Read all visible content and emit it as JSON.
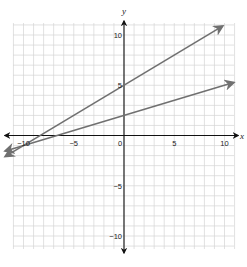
{
  "chart_data": {
    "type": "line",
    "title": "",
    "xlabel": "x",
    "ylabel": "y",
    "xlim": [
      -11,
      11
    ],
    "ylim": [
      -11.2,
      11.2
    ],
    "grid": true,
    "legend": null,
    "x_ticks": [
      {
        "value": -10,
        "label": "-10"
      },
      {
        "value": -5,
        "label": "-5"
      },
      {
        "value": 0,
        "label": "0"
      },
      {
        "value": 5,
        "label": "5"
      },
      {
        "value": 10,
        "label": "10"
      }
    ],
    "y_ticks": [
      {
        "value": 10,
        "label": "10"
      },
      {
        "value": 5,
        "label": "5"
      },
      {
        "value": -5,
        "label": "-5"
      },
      {
        "value": -10,
        "label": "-10"
      }
    ],
    "series": [
      {
        "name": "line-1",
        "equation": "y = 0.6x + 5",
        "x": [
          -11.8,
          0,
          9.8
        ],
        "y": [
          -2.08,
          5,
          10.88
        ],
        "y_intercept": 5,
        "slope": 0.6,
        "color": "#707070"
      },
      {
        "name": "line-2",
        "equation": "y = 0.3x + 2",
        "x": [
          -11.8,
          0,
          10.9
        ],
        "y": [
          -1.54,
          2,
          5.27
        ],
        "y_intercept": 2,
        "slope": 0.3,
        "color": "#707070"
      }
    ],
    "intersection": {
      "x": -10,
      "y": -1
    }
  },
  "style": {
    "axis_color": "#111111",
    "grid_color": "#d4d4d4",
    "line_color": "#707070"
  }
}
